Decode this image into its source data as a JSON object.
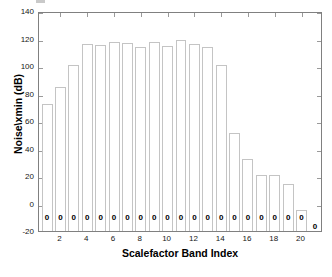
{
  "chart_data": {
    "type": "bar",
    "title": "",
    "xlabel": "Scalefactor Band Index",
    "ylabel": "Noise\\xmin (dB)",
    "xlim": [
      0.4,
      21.6
    ],
    "ylim": [
      -20,
      140
    ],
    "grid": false,
    "legend": null,
    "categories": [
      1,
      2,
      3,
      4,
      5,
      6,
      7,
      8,
      9,
      10,
      11,
      12,
      13,
      14,
      15,
      16,
      17,
      18,
      19,
      20,
      21
    ],
    "values": [
      73.5,
      86.0,
      102.5,
      117.5,
      117.0,
      119.0,
      118.5,
      115.5,
      119.0,
      116.0,
      120.5,
      117.5,
      115.5,
      102.5,
      53.0,
      33.5,
      22.5,
      22.0,
      15.5,
      -3.0,
      -20.0
    ],
    "bar_labels": [
      "0",
      "0",
      "0",
      "0",
      "0",
      "0",
      "0",
      "0",
      "0",
      "0",
      "0",
      "0",
      "0",
      "0",
      "0",
      "0",
      "0",
      "0",
      "0",
      "0",
      "0"
    ],
    "ytick_labels": [
      "140",
      "120",
      "100",
      "80",
      "60",
      "40",
      "20",
      "0",
      "-20"
    ],
    "ytick_values": [
      140,
      120,
      100,
      80,
      60,
      40,
      20,
      0,
      -20
    ],
    "xtick_labels": [
      "2",
      "4",
      "6",
      "8",
      "10",
      "12",
      "14",
      "16",
      "18",
      "20"
    ],
    "xtick_values": [
      2,
      4,
      6,
      8,
      10,
      12,
      14,
      16,
      18,
      20
    ],
    "colors": {
      "bar_edge": "#c4c4c4",
      "bar_face": "#ffffff",
      "axes": "#808080",
      "text": "#000000",
      "background": "#ffffff"
    }
  }
}
